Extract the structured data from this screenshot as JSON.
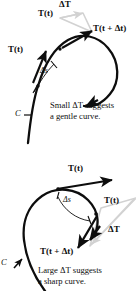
{
  "figure": {
    "colors": {
      "curve": "#0d0d0d",
      "vector": "#0d0d0d",
      "triangle": "#d2d2d2",
      "text": "#0d0d0d",
      "background": "#ffffff"
    },
    "panels": [
      {
        "id": "top",
        "caption_line1": "Small ΔT suggests",
        "caption_line2": "a gentle curve.",
        "caption_bold_symbol": "ΔT",
        "curve_label": "C",
        "arc_label": "Δs",
        "delta_label": "ΔT",
        "vector_t": "T(t)",
        "vector_t_dt": "T(t + Δt)",
        "vector_t_apex": "T(t)",
        "meaning": "small change in unit tangent vector implies gentle curvature"
      },
      {
        "id": "bottom",
        "caption_line1": "Large ΔT suggests",
        "caption_line2": "a sharp curve.",
        "caption_bold_symbol": "ΔT",
        "curve_label": "C",
        "arc_label": "Δs",
        "delta_label": "ΔT",
        "vector_t": "T(t)",
        "vector_t_dt": "T(t + Δt)",
        "vector_t_apex": "T(t)",
        "meaning": "large change in unit tangent vector implies sharp curvature"
      }
    ],
    "symbols": {
      "bold_T": "T",
      "italic_t": "t",
      "delta": "Δ",
      "plus": "+",
      "s": "s"
    }
  }
}
